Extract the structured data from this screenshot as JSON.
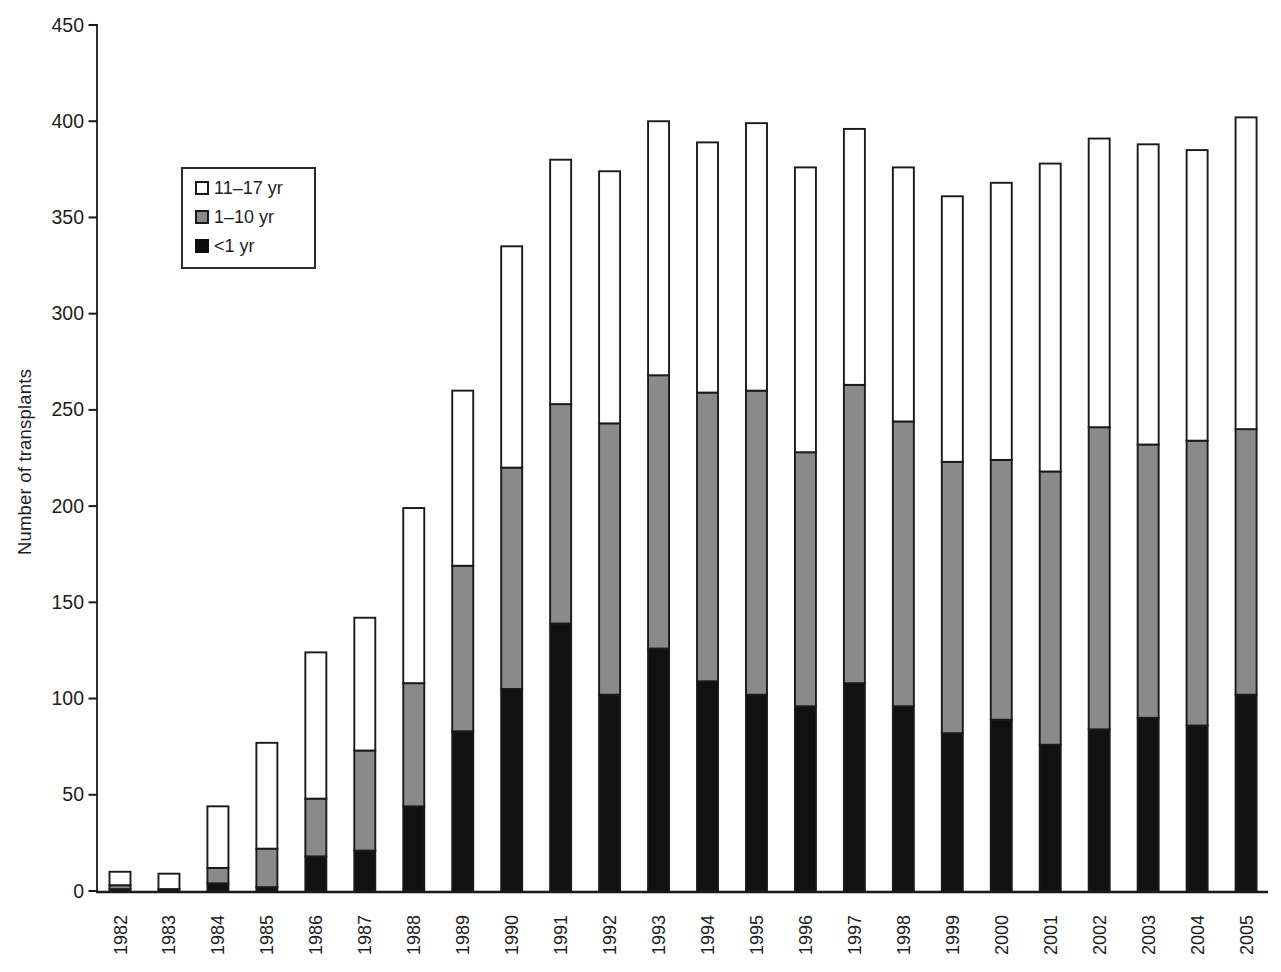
{
  "figure": {
    "background_color": "#fefefe",
    "axis_color": "#1a1a1a",
    "text_color": "#1d1d1d"
  },
  "chart_data": {
    "type": "bar",
    "stacked": true,
    "title": "",
    "xlabel": "",
    "ylabel": "Number of transplants",
    "ylim": [
      0,
      450
    ],
    "yticks": [
      0,
      50,
      100,
      150,
      200,
      250,
      300,
      350,
      400,
      450
    ],
    "grid": false,
    "legend_position": "upper-left",
    "categories": [
      "1982",
      "1983",
      "1984",
      "1985",
      "1986",
      "1987",
      "1988",
      "1989",
      "1990",
      "1991",
      "1992",
      "1993",
      "1994",
      "1995",
      "1996",
      "1997",
      "1998",
      "1999",
      "2000",
      "2001",
      "2002",
      "2003",
      "2004",
      "2005"
    ],
    "series": [
      {
        "name": "<1 yr",
        "color": "#111111",
        "values": [
          1,
          1,
          4,
          2,
          18,
          21,
          44,
          83,
          105,
          139,
          102,
          126,
          109,
          102,
          96,
          108,
          96,
          82,
          89,
          76,
          84,
          90,
          86,
          102
        ]
      },
      {
        "name": "1–10 yr",
        "color": "#8a8a8a",
        "values": [
          2,
          0,
          8,
          20,
          30,
          52,
          64,
          86,
          115,
          114,
          141,
          142,
          150,
          158,
          132,
          155,
          148,
          141,
          135,
          142,
          157,
          142,
          148,
          138
        ]
      },
      {
        "name": "11–17 yr",
        "color": "#fefefe",
        "values": [
          7,
          8,
          32,
          55,
          76,
          69,
          91,
          91,
          115,
          127,
          131,
          132,
          130,
          139,
          148,
          133,
          132,
          138,
          144,
          160,
          150,
          156,
          151,
          162
        ]
      }
    ],
    "totals": [
      10,
      9,
      44,
      77,
      124,
      142,
      199,
      260,
      335,
      380,
      374,
      400,
      389,
      399,
      376,
      396,
      376,
      361,
      368,
      378,
      391,
      388,
      385,
      402
    ]
  },
  "legend": {
    "items": [
      {
        "label": "11–17 yr",
        "swatch": "white-square-icon"
      },
      {
        "label": "1–10 yr",
        "swatch": "gray-square-icon"
      },
      {
        "label": "<1 yr",
        "swatch": "black-square-icon"
      }
    ]
  }
}
